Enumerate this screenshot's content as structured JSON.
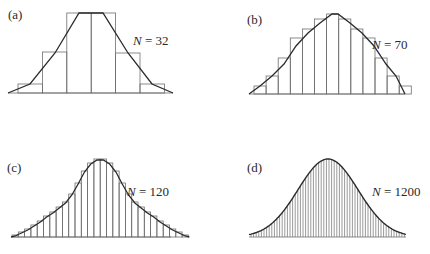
{
  "chart_data": [
    {
      "type": "bar",
      "panel": "(a)",
      "title": "N = 32",
      "n_label": "N",
      "n_value": "= 32",
      "baseline": 93,
      "x_start": 18,
      "bar_width": 24.4,
      "bar_tops": [
        84,
        52,
        13,
        13,
        53,
        84
      ],
      "curve": [
        [
          8,
          93
        ],
        [
          30,
          84
        ],
        [
          55,
          53
        ],
        [
          79,
          13
        ],
        [
          103,
          13
        ],
        [
          128,
          53
        ],
        [
          152,
          84
        ],
        [
          173,
          93
        ]
      ],
      "label_pos": {
        "x": 8,
        "y": 8
      },
      "n_pos": {
        "x": 132,
        "y": 34
      }
    },
    {
      "type": "bar",
      "panel": "(b)",
      "title": "N = 70",
      "n_label": "N",
      "n_value": "= 70",
      "baseline": 94,
      "x_start": 254,
      "bar_width": 12.1,
      "bar_tops": [
        86,
        76,
        58,
        38,
        29,
        19,
        14,
        19,
        29,
        38,
        58,
        76,
        86
      ],
      "curve": [
        [
          249,
          94
        ],
        [
          260,
          86
        ],
        [
          272,
          76
        ],
        [
          284,
          64
        ],
        [
          296,
          46
        ],
        [
          308,
          33
        ],
        [
          320,
          23
        ],
        [
          332,
          14
        ],
        [
          338,
          14
        ],
        [
          350,
          23
        ],
        [
          362,
          33
        ],
        [
          374,
          46
        ],
        [
          386,
          64
        ],
        [
          396,
          76
        ],
        [
          405,
          94
        ]
      ],
      "label_pos": {
        "x": 248,
        "y": 13
      },
      "n_pos": {
        "x": 371,
        "y": 38
      }
    },
    {
      "type": "bar",
      "panel": "(c)",
      "title": "N = 120",
      "n_label": "N",
      "n_value": "= 120",
      "baseline": 237,
      "x_start": 12,
      "bar_width": 6.3,
      "bar_tops": [
        235,
        232,
        229,
        225,
        221,
        216,
        212,
        207,
        202,
        194,
        183,
        171,
        163,
        159,
        159,
        163,
        171,
        183,
        194,
        202,
        207,
        212,
        216,
        221,
        225,
        229,
        232,
        235
      ],
      "curve": "gaussian",
      "peak": {
        "x": 91,
        "y": 159
      },
      "x_end": 171,
      "label_pos": {
        "x": 7,
        "y": 161
      },
      "n_pos": {
        "x": 127,
        "y": 185
      }
    },
    {
      "type": "bar",
      "panel": "(d)",
      "title": "N = 1200",
      "n_label": "N",
      "n_value": "= 1200",
      "baseline": 237,
      "x_start": 249,
      "x_end": 406,
      "bar_spacing": 2.6,
      "curve": "gaussian",
      "peak": {
        "x": 328,
        "y": 159
      },
      "sigma_px": 30,
      "label_pos": {
        "x": 248,
        "y": 161
      },
      "n_pos": {
        "x": 373,
        "y": 185
      }
    }
  ],
  "panels": {
    "a": {
      "label": "(a)",
      "n": "N",
      "eq": " = 32"
    },
    "b": {
      "label": "(b)",
      "n": "N",
      "eq": " = 70"
    },
    "c": {
      "label": "(c)",
      "n": "N",
      "eq": " = 120"
    },
    "d": {
      "label": "(d)",
      "n": "N",
      "eq": " = 1200"
    }
  },
  "colors": {
    "ink": "#2a2a2a",
    "bars": "#6e6e6e",
    "baseline": "#8a8a8a"
  }
}
